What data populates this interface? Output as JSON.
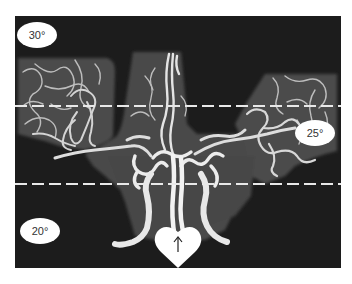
{
  "figure": {
    "colors": {
      "background": "#1c1c1c",
      "tissue": "#4a4a4a",
      "vessel": "#e6e6e6",
      "dashed_line": "#e8e8e8",
      "label_bg": "#ffffff",
      "label_text": "#333333"
    },
    "labels": [
      {
        "id": "top-left",
        "text": "30°"
      },
      {
        "id": "middle-right",
        "text": "25°"
      },
      {
        "id": "bottom-left",
        "text": "20°"
      }
    ],
    "dashed_lines": [
      {
        "id": "upper",
        "y": 106
      },
      {
        "id": "lower",
        "y": 184
      }
    ],
    "marker": {
      "shape": "heart",
      "icon": "arrow-up-icon",
      "glyph": "↑"
    }
  }
}
